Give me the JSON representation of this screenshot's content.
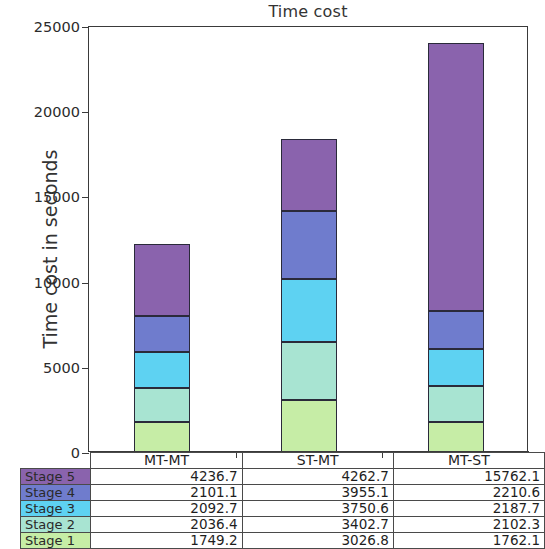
{
  "chart_data": {
    "type": "bar",
    "subtype": "stacked-bar",
    "title": "Time cost",
    "xlabel": "",
    "ylabel": "Time cost in seconds",
    "categories": [
      "MT-MT",
      "ST-MT",
      "MT-ST"
    ],
    "ylim": [
      0,
      25000
    ],
    "yticks": [
      0,
      5000,
      10000,
      15000,
      20000,
      25000
    ],
    "ytick_labels": [
      "0",
      "5000",
      "10000",
      "15000",
      "20000",
      "25000"
    ],
    "grid": false,
    "legend": "table-below",
    "stack_order_bottom_to_top": [
      "Stage 1",
      "Stage 2",
      "Stage 3",
      "Stage 4",
      "Stage 5"
    ],
    "series": [
      {
        "name": "Stage 1",
        "color": "#c6eda6",
        "values": [
          1749.2,
          3026.8,
          1762.1
        ]
      },
      {
        "name": "Stage 2",
        "color": "#a8e4d2",
        "values": [
          2036.4,
          3402.7,
          2102.3
        ]
      },
      {
        "name": "Stage 3",
        "color": "#5ed2f2",
        "values": [
          2092.7,
          3750.6,
          2187.7
        ]
      },
      {
        "name": "Stage 4",
        "color": "#6f7ccd",
        "values": [
          2101.1,
          3955.1,
          2210.6
        ]
      },
      {
        "name": "Stage 5",
        "color": "#8a63ad",
        "values": [
          4236.7,
          4262.7,
          15762.1
        ]
      }
    ],
    "totals": [
      12216.1,
      18397.9,
      24024.8
    ]
  },
  "table": {
    "corner_label": "",
    "column_headers": [
      "MT-MT",
      "ST-MT",
      "MT-ST"
    ],
    "rows": [
      {
        "label": "Stage 5",
        "swatch": "#8a63ad",
        "values": [
          "4236.7",
          "4262.7",
          "15762.1"
        ]
      },
      {
        "label": "Stage 4",
        "swatch": "#6f7ccd",
        "values": [
          "2101.1",
          "3955.1",
          "2210.6"
        ]
      },
      {
        "label": "Stage 3",
        "swatch": "#5ed2f2",
        "values": [
          "2092.7",
          "3750.6",
          "2187.7"
        ]
      },
      {
        "label": "Stage 2",
        "swatch": "#a8e4d2",
        "values": [
          "2036.4",
          "3402.7",
          "2102.3"
        ]
      },
      {
        "label": "Stage 1",
        "swatch": "#c6eda6",
        "values": [
          "1749.2",
          "3026.8",
          "1762.1"
        ]
      }
    ]
  },
  "colors": {
    "axis": "#3a3a3a",
    "background": "#ffffff",
    "bar_edge": "#2a2a3a",
    "text": "#262626"
  }
}
